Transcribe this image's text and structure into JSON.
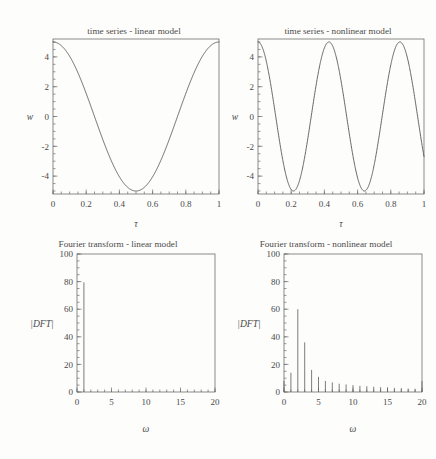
{
  "figure": {
    "caption": "",
    "background_color": "#fdfdfc",
    "ink_color": "#4a4a4a"
  },
  "panels": [
    {
      "id": "time-series-linear",
      "title": "time series - linear model",
      "xlabel": "τ",
      "ylabel": "w"
    },
    {
      "id": "time-series-nonlinear",
      "title": "time series - nonlinear model",
      "xlabel": "τ",
      "ylabel": "w"
    },
    {
      "id": "fourier-linear",
      "title": "Fourier transform - linear model",
      "xlabel": "ω",
      "ylabel": "|DFT|"
    },
    {
      "id": "fourier-nonlinear",
      "title": "Fourier transform - nonlinear model",
      "xlabel": "ω",
      "ylabel": "|DFT|"
    }
  ],
  "chart_data": [
    {
      "type": "line",
      "id": "time-series-linear",
      "title": "time series - linear model",
      "xlabel": "τ",
      "ylabel": "w",
      "xlim": [
        0,
        1
      ],
      "ylim": [
        -5.2,
        5.2
      ],
      "xticks": [
        0,
        0.2,
        0.4,
        0.6,
        0.8,
        1
      ],
      "xtick_labels": [
        "0",
        "0.2",
        "0.4",
        "0.6",
        "0.8",
        "1"
      ],
      "yticks": [
        -4,
        -2,
        0,
        2,
        4
      ],
      "ytick_labels": [
        "-4",
        "-2",
        "0",
        "2",
        "4"
      ],
      "grid": false,
      "legend": "none",
      "description": "single cosine oscillation, amplitude 5, one full period over tau 0 to 1",
      "formula": "w = 5*cos(2*pi*tau)",
      "amplitude": 5,
      "cycles": 1,
      "x": [
        0,
        0.05,
        0.1,
        0.15,
        0.2,
        0.25,
        0.3,
        0.35,
        0.4,
        0.45,
        0.5,
        0.55,
        0.6,
        0.65,
        0.7,
        0.75,
        0.8,
        0.85,
        0.9,
        0.95,
        1
      ],
      "y": [
        5,
        4.76,
        4.05,
        2.94,
        1.55,
        0,
        -1.55,
        -2.94,
        -4.05,
        -4.76,
        -5,
        -4.76,
        -4.05,
        -2.94,
        -1.55,
        0,
        1.55,
        2.94,
        4.05,
        4.76,
        5
      ]
    },
    {
      "type": "line",
      "id": "time-series-nonlinear",
      "title": "time series - nonlinear model",
      "xlabel": "τ",
      "ylabel": "w",
      "xlim": [
        0,
        1
      ],
      "ylim": [
        -5.2,
        5.2
      ],
      "xticks": [
        0,
        0.2,
        0.4,
        0.6,
        0.8,
        1
      ],
      "xtick_labels": [
        "0",
        "0.2",
        "0.4",
        "0.6",
        "0.8",
        "1"
      ],
      "yticks": [
        -4,
        -2,
        0,
        2,
        4
      ],
      "ytick_labels": [
        "-4",
        "-2",
        "0",
        "2",
        "4"
      ],
      "grid": false,
      "legend": "none",
      "description": "roughly 2.34 oscillations, amplitude 5, peaks near tau = 0, 0.43, 0.855 and troughs near tau = 0.215, 0.64; ends near -2.7 at tau = 1",
      "formula": "w = 5*cos(2*pi*2.34*tau)",
      "amplitude": 5,
      "cycles": 2.34,
      "peaks_tau": [
        0,
        0.43,
        0.855
      ],
      "troughs_tau": [
        0.215,
        0.64
      ],
      "end_value": -2.7
    },
    {
      "type": "bar",
      "id": "fourier-linear",
      "title": "Fourier transform - linear model",
      "xlabel": "ω",
      "ylabel": "|DFT|",
      "xlim": [
        0,
        20
      ],
      "ylim": [
        0,
        100
      ],
      "xticks": [
        0,
        5,
        10,
        15,
        20
      ],
      "xtick_labels": [
        "0",
        "5",
        "10",
        "15",
        "20"
      ],
      "yticks": [
        0,
        20,
        40,
        60,
        80,
        100
      ],
      "ytick_labels": [
        "0",
        "20",
        "40",
        "60",
        "80",
        "100"
      ],
      "grid": false,
      "legend": "none",
      "description": "single dominant spectral line at omega = 1 with magnitude about 80; all other frequencies essentially zero",
      "categories": [
        0,
        1,
        2,
        3,
        4,
        5,
        6,
        7,
        8,
        9,
        10,
        11,
        12,
        13,
        14,
        15,
        16,
        17,
        18,
        19,
        20
      ],
      "values": [
        0,
        79.5,
        0.3,
        0.2,
        0.2,
        0.2,
        0.2,
        0.2,
        0.2,
        0.2,
        0.2,
        0.2,
        0.2,
        0.2,
        0.2,
        0.2,
        0.2,
        0.2,
        0.2,
        0.2,
        0.3
      ]
    },
    {
      "type": "bar",
      "id": "fourier-nonlinear",
      "title": "Fourier transform - nonlinear model",
      "xlabel": "ω",
      "ylabel": "|DFT|",
      "xlim": [
        0,
        20
      ],
      "ylim": [
        0,
        100
      ],
      "xticks": [
        0,
        5,
        10,
        15,
        20
      ],
      "xtick_labels": [
        "0",
        "5",
        "10",
        "15",
        "20"
      ],
      "yticks": [
        0,
        20,
        40,
        60,
        80,
        100
      ],
      "ytick_labels": [
        "0",
        "20",
        "40",
        "60",
        "80",
        "100"
      ],
      "grid": false,
      "legend": "none",
      "description": "broad spectrum with dominant line at omega = 2 (about 60), secondary at omega = 3 (about 36), and a slowly decaying tail of leakage components out to omega = 20",
      "categories": [
        0,
        1,
        2,
        3,
        4,
        5,
        6,
        7,
        8,
        9,
        10,
        11,
        12,
        13,
        14,
        15,
        16,
        17,
        18,
        19,
        20
      ],
      "values": [
        8,
        14,
        60,
        36,
        16,
        11,
        8,
        7,
        6,
        5.5,
        5,
        4.5,
        4.2,
        3.8,
        3.5,
        3.2,
        3,
        2.8,
        2.5,
        2.3,
        8
      ]
    }
  ]
}
